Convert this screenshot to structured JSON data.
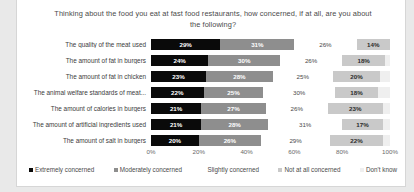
{
  "chart_data": {
    "type": "bar",
    "orientation": "horizontal",
    "stacked": true,
    "stack_mode": "percent",
    "title": "Thinking about the food you eat at fast food restaurants, how concerned, if at all, are you about the following?",
    "xlabel": "",
    "ylabel": "",
    "xlim": [
      0,
      100
    ],
    "grid": false,
    "legend_position": "bottom",
    "value_suffix": "%",
    "x_ticks": [
      "0%",
      "20%",
      "40%",
      "60%",
      "80%",
      "100%"
    ],
    "x_tick_values": [
      0,
      20,
      40,
      60,
      80,
      100
    ],
    "categories": [
      "The quality of the meat used",
      "The amount of fat in burgers",
      "The amount of fat in chicken",
      "The animal welfare standards of meat...",
      "The amount of calories in burgers",
      "The amount of artificial ingredients used",
      "The amount of salt in burgers"
    ],
    "series": [
      {
        "name": "Extremely concerned",
        "color": "#0a0a0a",
        "values": [
          29,
          24,
          23,
          22,
          21,
          21,
          20
        ],
        "labels": [
          "29%",
          "24%",
          "23%",
          "22%",
          "21%",
          "21%",
          "20%"
        ]
      },
      {
        "name": "Moderately concerned",
        "color": "#8e8e8e",
        "values": [
          31,
          30,
          28,
          25,
          27,
          28,
          26
        ],
        "labels": [
          "31%",
          "30%",
          "28%",
          "25%",
          "27%",
          "28%",
          "26%"
        ]
      },
      {
        "name": "Slightly concerned",
        "color": "#ffffff",
        "values": [
          26,
          26,
          25,
          30,
          26,
          31,
          29
        ],
        "labels": [
          "26%",
          "26%",
          "25%",
          "30%",
          "26%",
          "31%",
          "29%"
        ]
      },
      {
        "name": "Not at all concerned",
        "color": "#c9c9c9",
        "values": [
          14,
          18,
          20,
          18,
          23,
          17,
          22
        ],
        "labels": [
          "14%",
          "18%",
          "20%",
          "18%",
          "23%",
          "17%",
          "22%"
        ]
      },
      {
        "name": "Don't know",
        "color": "#efefef",
        "values": [
          0,
          2,
          4,
          5,
          3,
          3,
          3
        ],
        "labels": [
          "",
          "",
          "",
          "",
          "",
          "",
          ""
        ]
      }
    ]
  }
}
